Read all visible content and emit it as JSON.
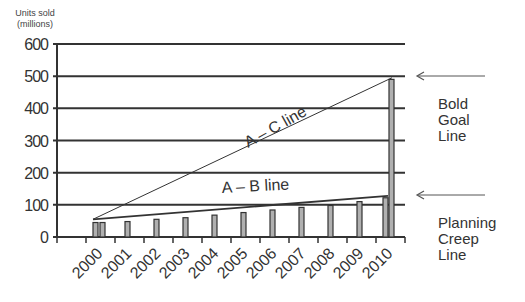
{
  "chart_data": {
    "type": "bar",
    "title": "",
    "xlabel": "",
    "ylabel": "Units sold (millions)",
    "ylabel_lines": [
      "Units sold",
      "(millions)"
    ],
    "ylim": [
      0,
      600
    ],
    "yticks": [
      0,
      100,
      200,
      300,
      400,
      500,
      600
    ],
    "grid": true,
    "categories": [
      "2000",
      "2001",
      "2002",
      "2003",
      "2004",
      "2005",
      "2006",
      "2007",
      "2008",
      "2009",
      "2010"
    ],
    "series": [
      {
        "name": "Planning Creep",
        "values": [
          45,
          48,
          55,
          60,
          68,
          76,
          84,
          92,
          98,
          110,
          122
        ]
      },
      {
        "name": "Bold Goal",
        "values": [
          45,
          null,
          null,
          null,
          null,
          null,
          null,
          null,
          null,
          null,
          490
        ]
      }
    ],
    "lines": [
      {
        "name": "A – C line",
        "from": {
          "x": "2000",
          "y": 55
        },
        "to": {
          "x": "2010",
          "y": 495
        }
      },
      {
        "name": "A – B line",
        "from": {
          "x": "2000",
          "y": 55
        },
        "to": {
          "x": "2010",
          "y": 128
        }
      }
    ],
    "annotations": [
      {
        "text": "Bold Goal Line",
        "lines": [
          "Bold",
          "Goal",
          "Line"
        ],
        "points_to": 500
      },
      {
        "text": "Planning Creep Line",
        "lines": [
          "Planning",
          "Creep",
          "Line"
        ],
        "points_to": 128
      }
    ],
    "legend": "none"
  },
  "labels": {
    "ac_line": "A – C line",
    "ab_line": "A – B line"
  }
}
